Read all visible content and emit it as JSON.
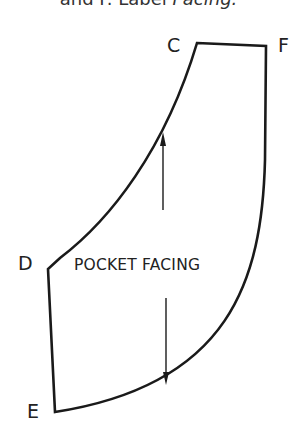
{
  "caption": {
    "prefix": "and F. Label ",
    "italic": "Facing."
  },
  "points": {
    "C": "C",
    "F": "F",
    "D": "D",
    "E": "E"
  },
  "piece_label": "POCKET FACING",
  "stroke_color": "#1a1a1a"
}
